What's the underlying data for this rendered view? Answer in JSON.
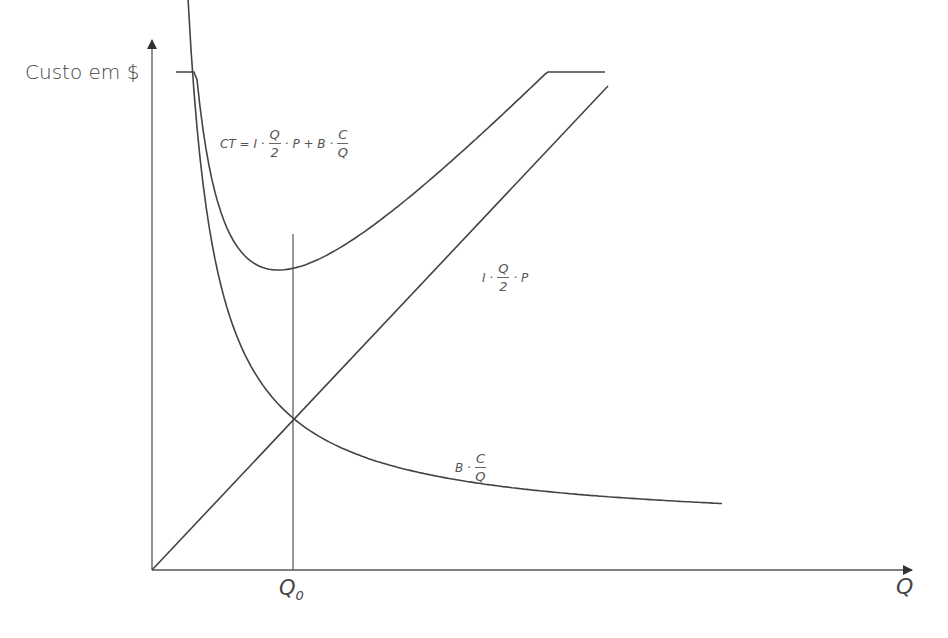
{
  "chart_data": {
    "type": "line",
    "title": "",
    "xlabel": "Q",
    "ylabel": "Custo em $",
    "grid": false,
    "legend": "none",
    "annotations": [
      "Q0 (optimal lot size, CT minimum)"
    ],
    "series": [
      {
        "name": "CT = I · Q/2 · P + B · C/Q",
        "shape": "U-shaped total cost curve, minimum at Q0"
      },
      {
        "name": "I · Q/2 · P",
        "shape": "straight line from origin"
      },
      {
        "name": "B · C/Q",
        "shape": "hyperbola decreasing toward an asymptote"
      }
    ]
  },
  "axis": {
    "y_label": "Custo em $",
    "x_label": "Q"
  },
  "marker": {
    "q0_main": "Q",
    "q0_sub": "0"
  },
  "labels": {
    "ct": {
      "lhs": "CT = I ·",
      "num1": "Q",
      "den1": "2",
      "mid": "· P + B ·",
      "num2": "C",
      "den2": "Q"
    },
    "linear": {
      "lhs": "I ·",
      "num": "Q",
      "den": "2",
      "rhs": "· P"
    },
    "hyper": {
      "lhs": "B ·",
      "num": "C",
      "den": "Q"
    }
  }
}
